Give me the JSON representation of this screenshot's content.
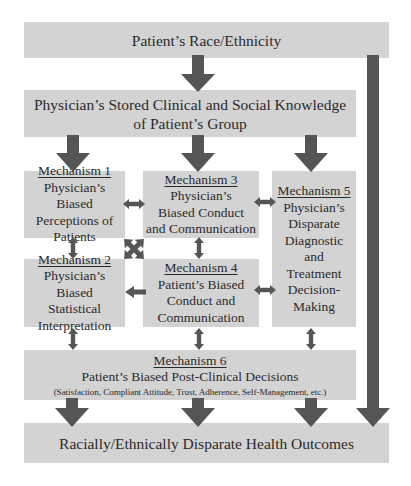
{
  "diagram": {
    "type": "flow-diagram",
    "colors": {
      "box_fill": "#d3d3d3",
      "arrow": "#555555",
      "text": "#2b2b2b"
    },
    "top_box": {
      "label": "Patient’s Race/Ethnicity"
    },
    "knowledge_box": {
      "line1": "Physician’s Stored Clinical and Social Knowledge",
      "line2": "of Patient’s Group"
    },
    "mechanisms": [
      {
        "id": 1,
        "title": "Mechanism 1",
        "lines": [
          "Physician’s Biased",
          "Perceptions of",
          "Patients"
        ]
      },
      {
        "id": 2,
        "title": "Mechanism 2",
        "lines": [
          "Physician’s Biased",
          "Statistical",
          "Interpretation"
        ]
      },
      {
        "id": 3,
        "title": "Mechanism 3",
        "lines": [
          "Physician’s",
          "Biased Conduct",
          "and Communication"
        ]
      },
      {
        "id": 4,
        "title": "Mechanism 4",
        "lines": [
          "Patient’s Biased",
          "Conduct and",
          "Communication"
        ]
      },
      {
        "id": 5,
        "title": "Mechanism 5",
        "lines": [
          "Physician’s",
          "Disparate",
          "Diagnostic",
          "and",
          "Treatment",
          "Decision-",
          "Making"
        ]
      },
      {
        "id": 6,
        "title": "Mechanism 6",
        "lines": [
          "Patient’s Biased Post-Clinical Decisions",
          "(Satisfaction, Compliant Attitude, Trust, Adherence, Self-Management, etc.)"
        ]
      }
    ],
    "outcome_box": {
      "label": "Racially/Ethnically Disparate Health Outcomes"
    },
    "edges": [
      {
        "from": "top_box",
        "to": "knowledge_box",
        "type": "arrow"
      },
      {
        "from": "top_box",
        "to": "outcome_box",
        "type": "arrow"
      },
      {
        "from": "knowledge_box",
        "to": "mechanism_1",
        "type": "arrow"
      },
      {
        "from": "knowledge_box",
        "to": "mechanism_3",
        "type": "arrow"
      },
      {
        "from": "knowledge_box",
        "to": "mechanism_5",
        "type": "arrow"
      },
      {
        "from": "mechanism_1",
        "to": "mechanism_3",
        "type": "double"
      },
      {
        "from": "mechanism_3",
        "to": "mechanism_5",
        "type": "double"
      },
      {
        "from": "mechanism_1",
        "to": "mechanism_2",
        "type": "double"
      },
      {
        "from": "mechanism_3",
        "to": "mechanism_4",
        "type": "double"
      },
      {
        "from": "mechanism_1",
        "to": "mechanism_4",
        "type": "double"
      },
      {
        "from": "mechanism_3",
        "to": "mechanism_2",
        "type": "double"
      },
      {
        "from": "mechanism_4",
        "to": "mechanism_2",
        "type": "arrow"
      },
      {
        "from": "mechanism_4",
        "to": "mechanism_5",
        "type": "double"
      },
      {
        "from": "mechanism_2",
        "to": "mechanism_6",
        "type": "double"
      },
      {
        "from": "mechanism_4",
        "to": "mechanism_6",
        "type": "double"
      },
      {
        "from": "mechanism_5",
        "to": "mechanism_6",
        "type": "double"
      },
      {
        "from": "mechanism_6",
        "to": "outcome_box",
        "type": "arrow",
        "count": 3
      }
    ]
  }
}
